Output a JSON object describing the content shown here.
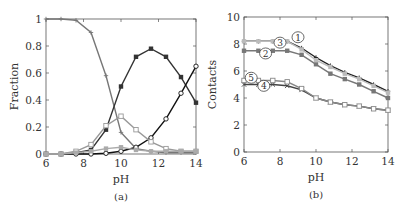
{
  "chart_data": [
    {
      "type": "line",
      "panel_label": "(a)",
      "xlabel": "pH",
      "ylabel": "Fraction",
      "xlim": [
        6,
        14
      ],
      "ylim": [
        0,
        1
      ],
      "xticks": [
        6,
        8,
        10,
        12,
        14
      ],
      "yticks": [
        0,
        0.2,
        0.4,
        0.6,
        0.8,
        1
      ],
      "ytick_labels": [
        "0",
        "0.2",
        "0.4",
        "0.6",
        "0.8",
        "1"
      ],
      "grid": false,
      "x": [
        6,
        6.8,
        7.6,
        8.4,
        9.2,
        10,
        10.8,
        11.6,
        12.4,
        13.2,
        14
      ],
      "series": [
        {
          "name": "plus",
          "marker": "plus",
          "color": "#777777",
          "values": [
            1.0,
            1.0,
            0.99,
            0.9,
            0.58,
            0.16,
            0.04,
            0.02,
            0.01,
            0.01,
            0.01
          ]
        },
        {
          "name": "filled-square",
          "marker": "filled-square",
          "color": "#333333",
          "values": [
            0.0,
            0.0,
            0.01,
            0.03,
            0.18,
            0.5,
            0.72,
            0.78,
            0.72,
            0.57,
            0.38
          ]
        },
        {
          "name": "open-circle",
          "marker": "open-circle",
          "color": "#111111",
          "values": [
            0.0,
            0.0,
            0.0,
            0.0,
            0.005,
            0.02,
            0.05,
            0.12,
            0.26,
            0.45,
            0.65
          ]
        },
        {
          "name": "open-square",
          "marker": "open-square",
          "color": "#999999",
          "values": [
            0.0,
            0.0,
            0.02,
            0.07,
            0.21,
            0.28,
            0.18,
            0.09,
            0.04,
            0.02,
            0.02
          ]
        },
        {
          "name": "gray-square-low",
          "marker": "square",
          "color": "#aaaaaa",
          "values": [
            0.0,
            0.0,
            0.01,
            0.02,
            0.04,
            0.05,
            0.03,
            0.02,
            0.02,
            0.02,
            0.02
          ]
        }
      ]
    },
    {
      "type": "line",
      "panel_label": "(b)",
      "xlabel": "pH",
      "ylabel": "Contacts",
      "xlim": [
        6,
        14
      ],
      "ylim": [
        0,
        10
      ],
      "xticks": [
        6,
        8,
        10,
        12,
        14
      ],
      "yticks": [
        0,
        2,
        4,
        6,
        8,
        10
      ],
      "grid": false,
      "x": [
        6,
        6.8,
        7.6,
        8.4,
        9.2,
        10,
        10.8,
        11.6,
        12.4,
        13.2,
        14
      ],
      "series": [
        {
          "name": "1",
          "marker": "plus",
          "color": "#222222",
          "values": [
            8.2,
            8.2,
            8.2,
            8.2,
            7.7,
            7.0,
            6.4,
            5.9,
            5.5,
            5.0,
            4.5
          ]
        },
        {
          "name": "2",
          "marker": "square",
          "color": "#777777",
          "values": [
            7.5,
            7.5,
            7.5,
            7.5,
            7.2,
            6.5,
            5.8,
            5.4,
            5.0,
            4.5,
            4.0
          ]
        },
        {
          "name": "3",
          "marker": "square",
          "color": "#bbbbbb",
          "values": [
            8.2,
            8.2,
            8.2,
            8.2,
            7.6,
            6.8,
            6.3,
            5.8,
            5.4,
            4.9,
            4.4
          ]
        },
        {
          "name": "4",
          "marker": "cross",
          "color": "#444444",
          "values": [
            5.0,
            5.0,
            5.0,
            4.9,
            4.6,
            4.0,
            3.7,
            3.5,
            3.4,
            3.2,
            3.1
          ]
        },
        {
          "name": "5",
          "marker": "open-square",
          "color": "#888888",
          "values": [
            5.3,
            5.3,
            5.3,
            5.2,
            4.7,
            4.0,
            3.7,
            3.5,
            3.4,
            3.2,
            3.1
          ]
        }
      ],
      "annotations": [
        {
          "text": "1",
          "x": 9.0,
          "y": 8.5
        },
        {
          "text": "3",
          "x": 8.0,
          "y": 8.1
        },
        {
          "text": "2",
          "x": 7.2,
          "y": 7.3
        },
        {
          "text": "5",
          "x": 6.4,
          "y": 5.5
        },
        {
          "text": "4",
          "x": 7.1,
          "y": 4.9
        }
      ]
    }
  ]
}
